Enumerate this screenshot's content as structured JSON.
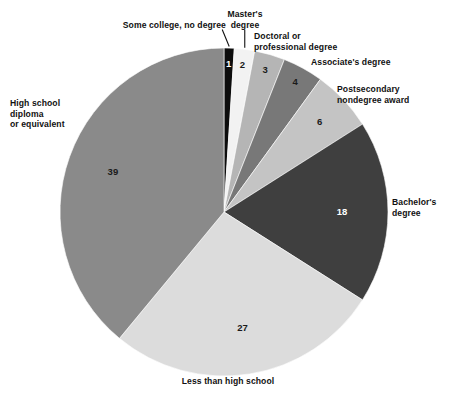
{
  "chart_data": {
    "type": "pie",
    "title": "",
    "subtitle": "",
    "xlabel": "",
    "ylabel": "",
    "legend_position": "none",
    "grid": false,
    "units": "percent",
    "total": 100,
    "start_angle_deg": 0,
    "direction": "clockwise",
    "categories": [
      "Some college, no degree",
      "Master's degree",
      "Doctoral or professional degree",
      "Associate's degree",
      "Postsecondary nondegree award",
      "Bachelor's degree",
      "Less than high school",
      "High school diploma or equivalent"
    ],
    "values": [
      1,
      2,
      3,
      4,
      6,
      18,
      27,
      39
    ],
    "colors": [
      "#0d0d0d",
      "#f2f2f2",
      "#b5b5b5",
      "#787878",
      "#c4c4c4",
      "#3f3f3f",
      "#dcdcdc",
      "#8a8a8a"
    ],
    "slices": [
      {
        "label": "Some college, no degree",
        "label_lines": [
          "Some college, no degree"
        ],
        "value": 1,
        "value_text": "1",
        "color": "#0d0d0d",
        "value_text_color": "#ffffff",
        "leader_line": true
      },
      {
        "label": "Master's degree",
        "label_lines": [
          "Master's",
          "degree"
        ],
        "value": 2,
        "value_text": "2",
        "color": "#f2f2f2",
        "value_text_color": "#1a1a1a",
        "leader_line": true
      },
      {
        "label": "Doctoral or professional degree",
        "label_lines": [
          "Doctoral or",
          "professional degree"
        ],
        "value": 3,
        "value_text": "3",
        "color": "#b5b5b5",
        "value_text_color": "#1a1a1a",
        "leader_line": false
      },
      {
        "label": "Associate's degree",
        "label_lines": [
          "Associate's degree"
        ],
        "value": 4,
        "value_text": "4",
        "color": "#787878",
        "value_text_color": "#1a1a1a",
        "leader_line": false
      },
      {
        "label": "Postsecondary nondegree award",
        "label_lines": [
          "Postsecondary",
          "nondegree award"
        ],
        "value": 6,
        "value_text": "6",
        "color": "#c4c4c4",
        "value_text_color": "#1a1a1a",
        "leader_line": false
      },
      {
        "label": "Bachelor's degree",
        "label_lines": [
          "Bachelor's",
          "degree"
        ],
        "value": 18,
        "value_text": "18",
        "color": "#3f3f3f",
        "value_text_color": "#ffffff",
        "leader_line": false
      },
      {
        "label": "Less than high school",
        "label_lines": [
          "Less than high school"
        ],
        "value": 27,
        "value_text": "27",
        "color": "#dcdcdc",
        "value_text_color": "#1a1a1a",
        "leader_line": false
      },
      {
        "label": "High school diploma or equivalent",
        "label_lines": [
          "High school",
          "diploma",
          "or equivalent"
        ],
        "value": 39,
        "value_text": "39",
        "color": "#8a8a8a",
        "value_text_color": "#1a1a1a",
        "leader_line": false
      }
    ]
  },
  "labels": {
    "some_college": "Some college, no degree",
    "masters": "Master's\ndegree",
    "doctoral": "Doctoral or\nprofessional degree",
    "associates": "Associate's degree",
    "postsecondary": "Postsecondary\nnondegree award",
    "bachelors": "Bachelor's\ndegree",
    "high_school": "High school\ndiploma\nor equivalent",
    "less_than_high_school": "Less than high school"
  },
  "values": {
    "some_college": "1",
    "masters": "2",
    "doctoral": "3",
    "associates": "4",
    "postsecondary": "6",
    "bachelors": "18",
    "less_than_high_school": "27",
    "high_school": "39"
  },
  "geometry": {
    "center_x": 224,
    "center_y": 212,
    "radius": 164
  }
}
